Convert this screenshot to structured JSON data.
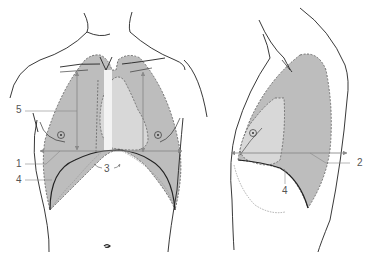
{
  "figure": {
    "type": "anatomical-diagram",
    "colors": {
      "lung_fill": "#bdbdbd",
      "lung_inner_fill": "#d8d8d8",
      "mediastinum_fill": "#f2f2f2",
      "outline": "#222222",
      "dashed_outline": "#555555",
      "arrow": "#8a8a8a",
      "label_text": "#555555"
    },
    "views": [
      {
        "id": "frontal",
        "name": "Front view of the chest"
      },
      {
        "id": "lateral",
        "name": "Side view of the chest"
      }
    ],
    "labels": [
      {
        "id": "1",
        "text": "1",
        "view": "frontal"
      },
      {
        "id": "2",
        "text": "2",
        "view": "lateral"
      },
      {
        "id": "3",
        "text": "3",
        "view": "frontal"
      },
      {
        "id": "4a",
        "text": "4",
        "view": "frontal"
      },
      {
        "id": "4b",
        "text": "4",
        "view": "lateral"
      },
      {
        "id": "5",
        "text": "5",
        "view": "frontal"
      }
    ]
  }
}
